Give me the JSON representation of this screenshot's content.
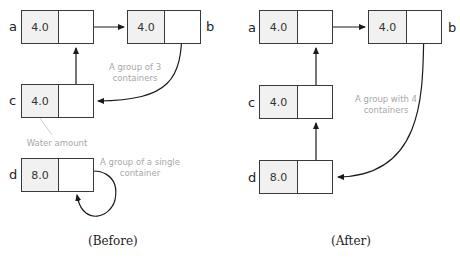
{
  "before": {
    "caption": "(Before)",
    "containers": [
      {
        "name": "a",
        "value": "4.0"
      },
      {
        "name": "b",
        "value": "4.0"
      },
      {
        "name": "c",
        "value": "4.0"
      },
      {
        "name": "d",
        "value": "8.0"
      }
    ],
    "notes": {
      "group3": "A group of 3 containers",
      "group3_l1": "A group of 3",
      "group3_l2": "containers",
      "water": "Water amount",
      "single_l1": "A group of a single",
      "single_l2": "container"
    }
  },
  "after": {
    "caption": "(After)",
    "containers": [
      {
        "name": "a",
        "value": "4.0"
      },
      {
        "name": "b",
        "value": "4.0"
      },
      {
        "name": "c",
        "value": "4.0"
      },
      {
        "name": "d",
        "value": "8.0"
      }
    ],
    "notes": {
      "group4_l1": "A group with 4",
      "group4_l2": "containers"
    }
  },
  "colors": {
    "line": "#1a1a1a",
    "note": "#a8a8a8",
    "value_bg": "#f1f1f1"
  }
}
